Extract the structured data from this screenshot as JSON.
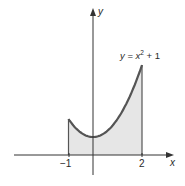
{
  "chart_data": {
    "type": "area",
    "title": "",
    "function_label": "y = x² + 1",
    "function_label_parts": {
      "lhs": "y",
      "eq": " = ",
      "var": "x",
      "exp": "2",
      "rest": " + 1"
    },
    "xlabel": "x",
    "ylabel": "y",
    "x_ticks": [
      {
        "value": -1,
        "label": "−1"
      },
      {
        "value": 2,
        "label": "2"
      }
    ],
    "shaded_interval": [
      -1,
      2
    ],
    "x": [
      -1,
      -0.5,
      0,
      0.5,
      1,
      1.5,
      2
    ],
    "values": [
      2,
      1.25,
      1,
      1.25,
      2,
      3.25,
      5
    ],
    "grid": false,
    "legend": "none",
    "colors": {
      "curve": "#555555",
      "fill": "#e6e6e6",
      "axis": "#333333"
    }
  }
}
